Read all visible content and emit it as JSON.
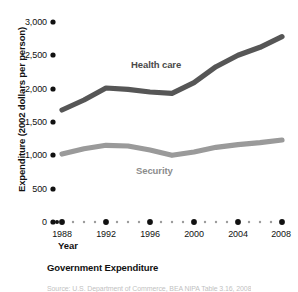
{
  "figure": {
    "caption": "Government Expenditure",
    "source_partial": "Source: U.S. Department of Commerce, BEA NIPA Table 3.16, 2008"
  },
  "chart_data": {
    "type": "line",
    "title": "Government Expenditure",
    "xlabel": "Year",
    "ylabel": "Expenditure (2002 dollars per person)",
    "xlim": [
      1988,
      2008
    ],
    "ylim": [
      0,
      3000
    ],
    "grid": false,
    "legend_position": "inline-annotations",
    "x_ticks": [
      "1988",
      "1992",
      "1996",
      "2000",
      "2004",
      "2008"
    ],
    "y_ticks": [
      "0",
      "500",
      "1,000",
      "1,500",
      "2,000",
      "2,500",
      "3,000"
    ],
    "x": [
      1988,
      1990,
      1992,
      1994,
      1996,
      1998,
      2000,
      2002,
      2004,
      2006,
      2008
    ],
    "series": [
      {
        "name": "Health care",
        "color": "#565656",
        "values": [
          1680,
          1830,
          2010,
          1990,
          1950,
          1930,
          2090,
          2330,
          2500,
          2620,
          2780
        ]
      },
      {
        "name": "Security",
        "color": "#9a9a9a",
        "values": [
          1020,
          1100,
          1150,
          1140,
          1080,
          1000,
          1050,
          1120,
          1160,
          1190,
          1230
        ]
      }
    ],
    "annotations": [
      {
        "text": "Health care",
        "x": 1996.5,
        "y": 2330
      },
      {
        "text": "Security",
        "x": 1997.5,
        "y": 820
      }
    ]
  }
}
